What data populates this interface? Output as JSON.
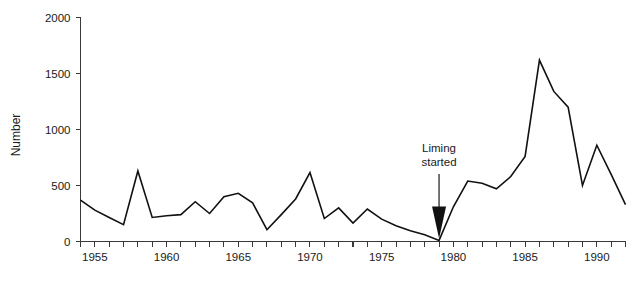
{
  "chart_data": {
    "type": "line",
    "title": "",
    "xlabel": "",
    "ylabel": "Number",
    "xlim": [
      1954,
      1992
    ],
    "ylim": [
      0,
      2000
    ],
    "grid": false,
    "legend": null,
    "y_ticks": [
      0,
      500,
      1000,
      1500,
      2000
    ],
    "y_tick_labels": [
      "0",
      "500",
      "1000",
      "1500",
      "2000"
    ],
    "x_ticks": [
      1954,
      1955,
      1956,
      1957,
      1958,
      1959,
      1960,
      1961,
      1962,
      1963,
      1964,
      1965,
      1966,
      1967,
      1968,
      1969,
      1970,
      1971,
      1972,
      1973,
      1974,
      1975,
      1976,
      1977,
      1978,
      1979,
      1980,
      1981,
      1982,
      1983,
      1984,
      1985,
      1986,
      1987,
      1988,
      1989,
      1990,
      1991,
      1992
    ],
    "x_tick_labels": [
      "1955",
      "1960",
      "1965",
      "1970",
      "1975",
      "1980",
      "1985",
      "1990"
    ],
    "x_labeled_ticks": [
      1955,
      1960,
      1965,
      1970,
      1975,
      1980,
      1985,
      1990
    ],
    "series": [
      {
        "name": "Number",
        "x": [
          1954,
          1955,
          1956,
          1957,
          1958,
          1959,
          1960,
          1961,
          1962,
          1963,
          1964,
          1965,
          1966,
          1967,
          1968,
          1969,
          1970,
          1971,
          1972,
          1973,
          1974,
          1975,
          1976,
          1977,
          1978,
          1979,
          1980,
          1981,
          1982,
          1983,
          1984,
          1985,
          1986,
          1987,
          1988,
          1989,
          1990,
          1991,
          1992
        ],
        "values": [
          370,
          280,
          215,
          150,
          630,
          215,
          230,
          240,
          355,
          250,
          400,
          430,
          345,
          105,
          240,
          380,
          615,
          205,
          300,
          165,
          290,
          200,
          140,
          95,
          60,
          10,
          310,
          540,
          520,
          470,
          580,
          760,
          1620,
          1340,
          1200,
          500,
          860,
          600,
          330
        ]
      }
    ],
    "annotations": [
      {
        "name": "liming-started",
        "text_line1": "Liming",
        "text_line2": "started",
        "point_x": 1979,
        "point_y": 0,
        "arrow": "down"
      }
    ],
    "colors": {
      "line": "#111111",
      "axis": "#3a3a3a",
      "text": "#1a1a1a",
      "background": "#ffffff"
    }
  }
}
